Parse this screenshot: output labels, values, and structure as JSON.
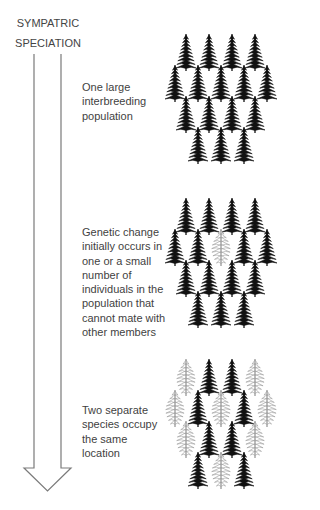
{
  "title": {
    "line1": "SYMPATRIC",
    "line2": "SPECIATION"
  },
  "arrow": {
    "direction": "down",
    "shaft_left_x": 34,
    "shaft_right_x": 61,
    "top_y": 54,
    "head_base_y": 468,
    "tip_y": 491,
    "stroke": "#777777"
  },
  "stages": [
    {
      "text": "One large interbreeding population",
      "lines": [
        "One large",
        "interbreeding",
        "population"
      ],
      "top": 80,
      "grove_top": 32,
      "trees": [
        [
          "dark",
          "dark",
          "dark",
          "dark"
        ],
        [
          "dark",
          "dark",
          "dark",
          "dark",
          "dark"
        ],
        [
          "dark",
          "dark",
          "dark",
          "dark"
        ],
        [
          "dark",
          "dark",
          "dark"
        ]
      ]
    },
    {
      "text": "Genetic change initially occurs in one or a small number of individuals in the population that cannot mate with other members",
      "lines": [
        "Genetic change",
        "initially occurs in",
        "one or a small",
        "number of",
        "individuals in the",
        "population that",
        "cannot mate with",
        "other members"
      ],
      "top": 225,
      "grove_top": 196,
      "trees": [
        [
          "dark",
          "dark",
          "dark",
          "dark"
        ],
        [
          "dark",
          "dark",
          "light",
          "dark",
          "dark"
        ],
        [
          "dark",
          "dark",
          "dark",
          "dark"
        ],
        [
          "dark",
          "dark",
          "dark"
        ]
      ]
    },
    {
      "text": "Two separate species occupy the same location",
      "lines": [
        "Two separate",
        "species occupy",
        "the same",
        "location"
      ],
      "top": 403,
      "grove_top": 357,
      "trees": [
        [
          "light",
          "dark",
          "dark",
          "light"
        ],
        [
          "light",
          "dark",
          "light",
          "dark",
          "light"
        ],
        [
          "light",
          "dark",
          "dark",
          "light"
        ],
        [
          "dark",
          "light",
          "dark"
        ]
      ]
    }
  ],
  "colors": {
    "dark_tree": "#111111",
    "light_tree": "#9a9a9a",
    "text": "#3f3f3f"
  }
}
